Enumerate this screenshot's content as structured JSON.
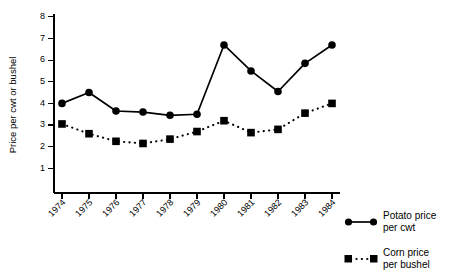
{
  "chart_data": {
    "type": "line",
    "title": "",
    "xlabel": "",
    "ylabel": "Price per cwt or bushel",
    "x": [
      "1974",
      "1975",
      "1976",
      "1977",
      "1978",
      "1979",
      "1980",
      "1981",
      "1982",
      "1983",
      "1984"
    ],
    "xtick_labels": [
      "1974",
      "1975",
      "1976",
      "1977",
      "1978",
      "1979",
      "1980",
      "1981",
      "1982",
      "1983",
      "1984"
    ],
    "ytick_labels": [
      "1",
      "2",
      "3",
      "4",
      "5",
      "6",
      "7",
      "8"
    ],
    "ytick_values": [
      1,
      2,
      3,
      4,
      5,
      6,
      7,
      8
    ],
    "ylim": [
      0,
      8
    ],
    "grid": false,
    "legend_position": "right-bottom",
    "series": [
      {
        "name": "Potato price per cwt",
        "legend_label_line1": "Potato price",
        "legend_label_line2": "per cwt",
        "marker": "circle",
        "linestyle": "solid",
        "color": "#000000",
        "values": [
          4.0,
          4.5,
          3.65,
          3.6,
          3.45,
          3.5,
          6.7,
          5.5,
          4.55,
          5.85,
          6.7
        ]
      },
      {
        "name": "Corn price per bushel",
        "legend_label_line1": "Corn price",
        "legend_label_line2": "per bushel",
        "marker": "square",
        "linestyle": "dotted",
        "color": "#000000",
        "values": [
          3.05,
          2.6,
          2.25,
          2.15,
          2.35,
          2.7,
          3.2,
          2.65,
          2.8,
          3.55,
          4.0
        ]
      }
    ]
  }
}
